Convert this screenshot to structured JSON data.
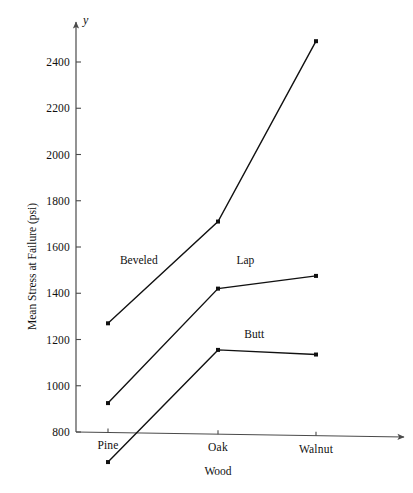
{
  "chart_data": {
    "type": "line",
    "title": "",
    "subtitle": "",
    "xlabel": "Wood",
    "ylabel": "Mean Stress at Failure (psi)",
    "y_var_symbol": "y",
    "categories": [
      "Pine",
      "Oak",
      "Walnut"
    ],
    "ylim": [
      800,
      2500
    ],
    "y_ticks": [
      800,
      1000,
      1200,
      1400,
      1600,
      1800,
      2000,
      2200,
      2400
    ],
    "y_tick_labels": [
      "800",
      "1000",
      "1200",
      "1400",
      "1600",
      "1800",
      "2000",
      "2200",
      "2400"
    ],
    "grid": false,
    "legend": "inline-labels",
    "legend_position": "inline",
    "series": [
      {
        "name": "Beveled",
        "values": [
          1270,
          1710,
          2490
        ],
        "label_x_category_fraction": 0.28,
        "label_value": 1545
      },
      {
        "name": "Lap",
        "values": [
          925,
          1420,
          1475
        ],
        "label_x_category_fraction": 1.28,
        "label_value": 1545
      },
      {
        "name": "Butt",
        "values": [
          670,
          1155,
          1135
        ],
        "label_x_category_fraction": 1.37,
        "label_value": 1225
      }
    ],
    "notes": {
      "butt_pine_below_axis": "The Butt series Pine point (670 psi) is plotted below the drawn x-axis baseline of 800",
      "axis_arrows": "Both x and y axes are drawn as arrows"
    }
  },
  "marker": {
    "shape": "filled-square",
    "color": "#111111",
    "size_px": 4
  },
  "line_style": {
    "color": "#111111",
    "width_px": 1.4
  },
  "axis_style": {
    "color": "#4a4a4a",
    "width_px": 1.2
  }
}
